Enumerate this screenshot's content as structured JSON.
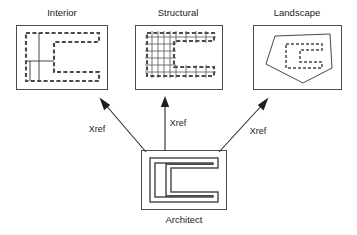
{
  "diagram": {
    "type": "xref-relationship-diagram",
    "title_visible": false,
    "nodes": [
      {
        "id": "interior",
        "label": "Interior",
        "label_x": 62,
        "label_y": 16,
        "box": {
          "x": 16,
          "y": 25,
          "w": 92,
          "h": 65
        },
        "drawing": "interior-floor-plan-dashed"
      },
      {
        "id": "structural",
        "label": "Structural",
        "label_x": 178,
        "label_y": 16,
        "box": {
          "x": 135,
          "y": 25,
          "w": 88,
          "h": 65
        },
        "drawing": "structural-grid-plan"
      },
      {
        "id": "landscape",
        "label": "Landscape",
        "label_x": 297,
        "label_y": 16,
        "box": {
          "x": 253,
          "y": 25,
          "w": 89,
          "h": 65
        },
        "drawing": "landscape-site-plan"
      },
      {
        "id": "architect",
        "label": "Architect",
        "label_x": 184,
        "label_y": 223,
        "box": {
          "x": 141,
          "y": 150,
          "w": 86,
          "h": 60
        },
        "drawing": "architect-base-plan-double-wall"
      }
    ],
    "edges": [
      {
        "id": "edge-architect-to-interior",
        "label": "Xref",
        "label_x": 97,
        "label_y": 132,
        "from": "architect",
        "to": "interior",
        "x1": 146,
        "y1": 152,
        "x2": 101,
        "y2": 99
      },
      {
        "id": "edge-architect-to-structural",
        "label": "Xref",
        "label_x": 178,
        "label_y": 126,
        "from": "architect",
        "to": "structural",
        "x1": 165,
        "y1": 150,
        "x2": 165,
        "y2": 97
      },
      {
        "id": "edge-architect-to-landscape",
        "label": "Xref",
        "label_x": 258,
        "label_y": 134,
        "from": "architect",
        "to": "landscape",
        "x1": 219,
        "y1": 152,
        "x2": 268,
        "y2": 99
      }
    ],
    "colors": {
      "frame_stroke": "#4d4d4d",
      "plan_stroke": "#4a4a4a",
      "arrow": "#1f1f1f",
      "text": "#1a1a1a",
      "background": "#ffffff"
    }
  }
}
